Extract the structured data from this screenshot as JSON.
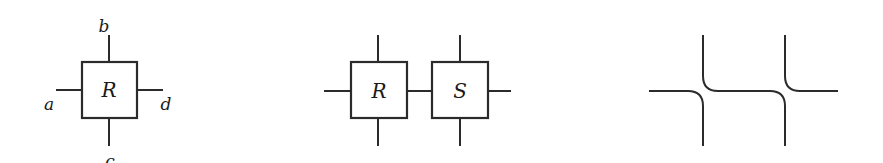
{
  "diagram_1": {
    "box_label": "R",
    "ports": {
      "top": "b",
      "left": "a",
      "right": "d",
      "bottom": "c"
    }
  },
  "diagram_2": {
    "boxes": [
      {
        "label": "R"
      },
      {
        "label": "S"
      }
    ]
  },
  "diagram_3": {
    "description": "two crossing-free curved wire junctions (resolved tiles)"
  },
  "colors": {
    "stroke": "#2b2b2b",
    "background": "#ffffff"
  }
}
